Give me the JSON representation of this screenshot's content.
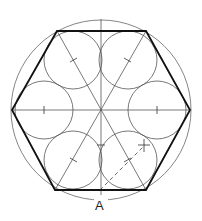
{
  "diagram": {
    "label_point": "A",
    "colors": {
      "thin": "#555555",
      "thick": "#111111",
      "background": "#ffffff"
    },
    "outer_circle": {
      "cx": 101,
      "cy": 110,
      "r": 90
    },
    "hexagon_vertices": [
      [
        12,
        110
      ],
      [
        57,
        31
      ],
      [
        146,
        31
      ],
      [
        190,
        110
      ],
      [
        146,
        190
      ],
      [
        55,
        190
      ]
    ],
    "small_circle_radius": 29,
    "small_circle_centers": [
      [
        44,
        110
      ],
      [
        73,
        60
      ],
      [
        128,
        60
      ],
      [
        157,
        110
      ],
      [
        128,
        160
      ],
      [
        73,
        160
      ]
    ]
  }
}
